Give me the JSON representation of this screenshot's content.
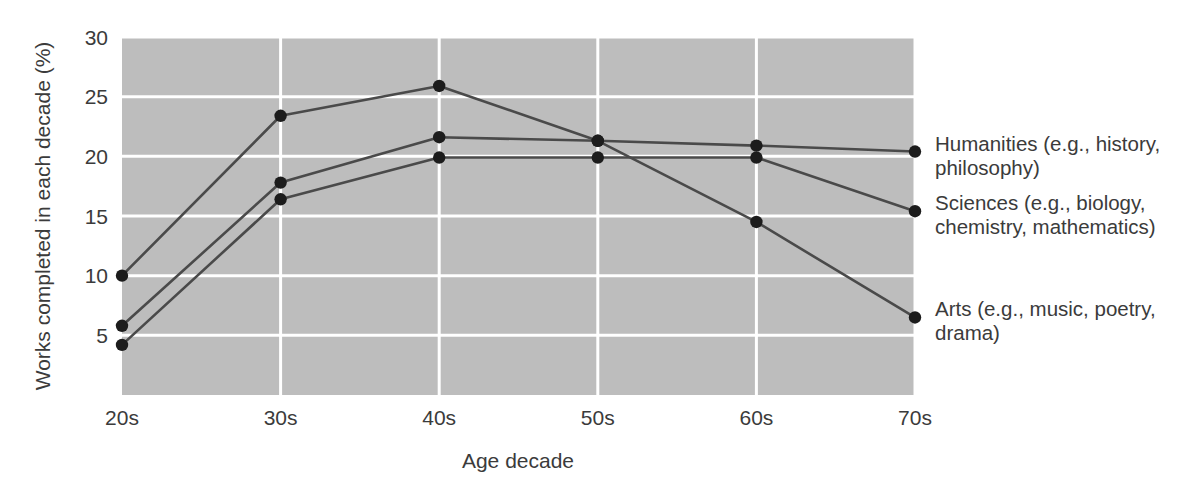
{
  "chart_data": {
    "type": "line",
    "title": "",
    "xlabel": "Age decade",
    "ylabel": "Works completed in each decade (%)",
    "categories": [
      "20s",
      "30s",
      "40s",
      "50s",
      "60s",
      "70s"
    ],
    "xtick_labels": [
      "20s",
      "30s",
      "40s",
      "50s",
      "60s",
      "70s"
    ],
    "ytick_labels": [
      "5",
      "10",
      "15",
      "20",
      "25",
      "30"
    ],
    "ytick_values": [
      5,
      10,
      15,
      20,
      25,
      30
    ],
    "ylim": [
      0,
      30
    ],
    "grid": true,
    "grid_color": "#ffffff",
    "plot_background": "#bdbdbd",
    "legend_position": "right-inline-labels",
    "line_color": "#4a4a4a",
    "marker_color": "#1c1c1c",
    "series": [
      {
        "name": "Arts (e.g., music, poetry, drama)",
        "label_line1": "Arts (e.g., music, poetry,",
        "label_line2": "drama)",
        "values": [
          10.0,
          23.4,
          25.9,
          21.3,
          14.5,
          6.5
        ]
      },
      {
        "name": "Humanities (e.g., history, philosophy)",
        "label_line1": "Humanities (e.g., history,",
        "label_line2": "philosophy)",
        "values": [
          5.8,
          17.8,
          21.6,
          21.3,
          20.9,
          20.4
        ]
      },
      {
        "name": "Sciences (e.g., biology, chemistry, mathematics)",
        "label_line1": "Sciences (e.g., biology,",
        "label_line2": "chemistry, mathematics)",
        "values": [
          4.2,
          16.4,
          19.9,
          19.9,
          19.9,
          15.4
        ]
      }
    ]
  }
}
